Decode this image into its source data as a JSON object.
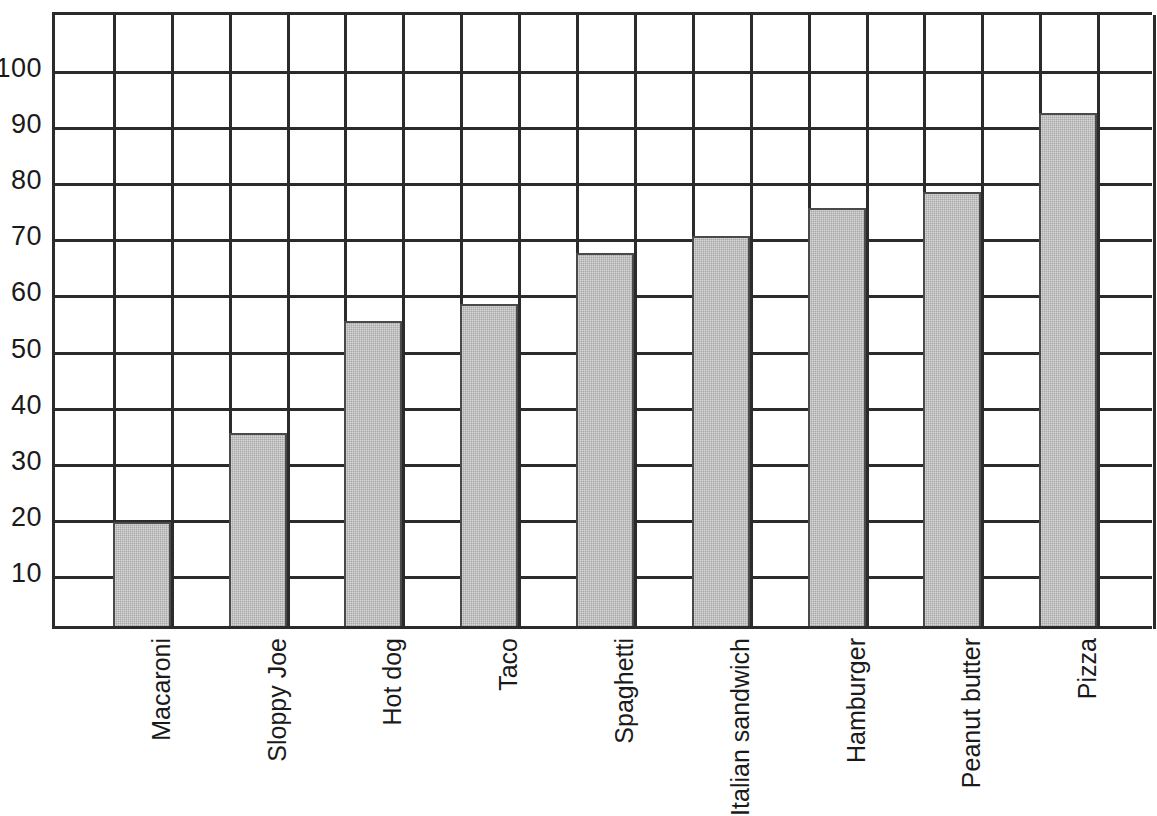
{
  "chart_data": {
    "type": "bar",
    "title": "",
    "subtitle": "",
    "xlabel": "",
    "ylabel": "",
    "categories": [
      "Macaroni",
      "Sloppy Joe",
      "Hot dog",
      "Taco",
      "Spaghetti",
      "Italian sandwich",
      "Hamburger",
      "Peanut butter",
      "Pizza"
    ],
    "values": [
      19,
      35,
      55,
      58,
      67,
      70,
      75,
      78,
      92
    ],
    "ylim": [
      0,
      110
    ],
    "yticks": [
      10,
      20,
      30,
      40,
      50,
      60,
      70,
      80,
      90,
      100
    ],
    "ytick_labels": [
      "10",
      "20",
      "30",
      "40",
      "50",
      "60",
      "70",
      "80",
      "90",
      "100"
    ],
    "grid": "both",
    "legend": "none",
    "annotations": [],
    "colors": {
      "bar_fill": "#a8a8a8",
      "bar_edge": "#4a4a4a",
      "gridline": "#2b2b2b",
      "axis": "#2b2b2b",
      "text": "#1a1a1a",
      "background": "#ffffff"
    }
  }
}
